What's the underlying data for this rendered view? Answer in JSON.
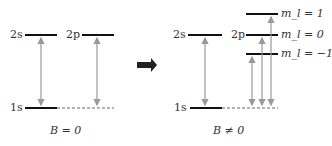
{
  "left": {
    "caption": "B = 0",
    "labels": {
      "s2": "2s",
      "p2": "2p",
      "s1": "1s"
    }
  },
  "right": {
    "caption": "B ≠ 0",
    "labels": {
      "s2": "2s",
      "p2": "2p",
      "s1": "1s",
      "ml_p1": "m_l = 1",
      "ml_0": "m_l = 0",
      "ml_m1": "m_l = −1"
    }
  },
  "colors": {
    "level": "#111111",
    "arrow": "#999999",
    "dashed": "#666666",
    "transition_arrow": "#222222"
  }
}
